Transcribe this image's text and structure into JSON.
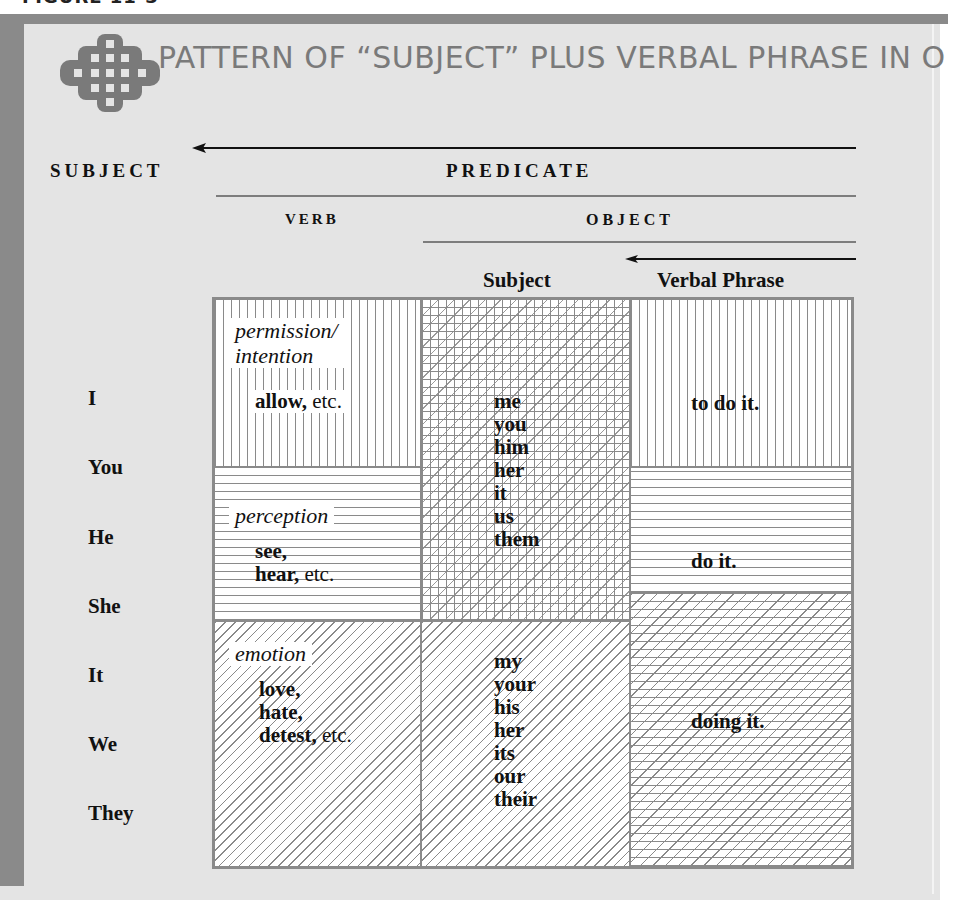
{
  "figure": {
    "caption_clipped": "FIGURE 11-3",
    "title": "PATTERN OF “SUBJECT” PLUS VERBAL PHRASE IN O",
    "logo_icon": "celtic-lattice-diamond-icon"
  },
  "headers": {
    "subject": "SUBJECT",
    "predicate": "PREDICATE",
    "verb": "VERB",
    "object": "OBJECT",
    "object_subject": "Subject",
    "verbal_phrase": "Verbal Phrase"
  },
  "pronouns": [
    "I",
    "You",
    "He",
    "She",
    "It",
    "We",
    "They"
  ],
  "verb_groups": [
    {
      "category": "permission/",
      "category2": "intention",
      "lines": [
        {
          "bold": "allow,",
          "plain": " etc."
        }
      ]
    },
    {
      "category": "perception",
      "lines": [
        {
          "bold": "see,",
          "plain": ""
        },
        {
          "bold": "hear,",
          "plain": " etc."
        }
      ]
    },
    {
      "category": "emotion",
      "lines": [
        {
          "bold": "love,",
          "plain": ""
        },
        {
          "bold": "hate,",
          "plain": ""
        },
        {
          "bold": "detest,",
          "plain": " etc."
        }
      ]
    }
  ],
  "object_subjects": {
    "objective": [
      "me",
      "you",
      "him",
      "her",
      "it",
      "us",
      "them"
    ],
    "possessive": [
      "my",
      "your",
      "his",
      "her",
      "its",
      "our",
      "their"
    ]
  },
  "verbal_phrases": [
    "to do it.",
    "do it.",
    "doing it."
  ],
  "colors": {
    "panel_bg": "#e4e4e4",
    "bar": "#8a8a8a",
    "title_text": "#7a7a7a",
    "pattern_line": "#8a8a8a"
  }
}
